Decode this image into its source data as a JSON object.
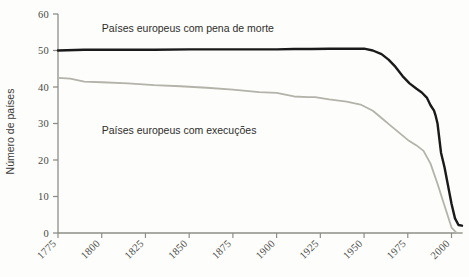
{
  "chart_data": {
    "type": "line",
    "title": "",
    "xlabel": "",
    "ylabel": "Número de países",
    "xlim": [
      1775,
      2006
    ],
    "ylim": [
      0,
      60
    ],
    "grid": false,
    "legend_position": "inline-annotations",
    "xticks": [
      1775,
      1800,
      1825,
      1850,
      1875,
      1900,
      1925,
      1950,
      1975,
      2000
    ],
    "xtick_labels": [
      "1775",
      "1800",
      "1825",
      "1850",
      "1875",
      "1900",
      "1925",
      "1950",
      "1975",
      "2000"
    ],
    "yticks": [
      0,
      10,
      20,
      30,
      40,
      50,
      60
    ],
    "ytick_labels": [
      "0",
      "10",
      "20",
      "30",
      "40",
      "50",
      "60"
    ],
    "series": [
      {
        "name": "Países europeus com pena de morte",
        "color": "#1a1a1a",
        "label_x": 1800,
        "label_y": 55,
        "x": [
          1775,
          1790,
          1810,
          1830,
          1850,
          1870,
          1890,
          1900,
          1910,
          1920,
          1930,
          1940,
          1945,
          1950,
          1955,
          1960,
          1964,
          1968,
          1972,
          1976,
          1980,
          1983,
          1986,
          1988,
          1990,
          1991,
          1992,
          1994,
          1996,
          1998,
          2000,
          2002,
          2004,
          2006
        ],
        "values": [
          50,
          50.2,
          50.2,
          50.2,
          50.3,
          50.3,
          50.3,
          50.3,
          50.4,
          50.4,
          50.5,
          50.5,
          50.5,
          50.5,
          50,
          49,
          47.5,
          45.5,
          43,
          41,
          39.5,
          38.5,
          37,
          35,
          33.5,
          32,
          30,
          22,
          18,
          13,
          8,
          4,
          2.2,
          2
        ]
      },
      {
        "name": "Países europeus com execuções",
        "color": "#b3b3aa",
        "label_x": 1800,
        "label_y": 27,
        "x": [
          1775,
          1782,
          1790,
          1800,
          1815,
          1830,
          1845,
          1860,
          1875,
          1890,
          1900,
          1910,
          1918,
          1922,
          1930,
          1940,
          1948,
          1955,
          1960,
          1965,
          1970,
          1975,
          1980,
          1984,
          1988,
          1992,
          1995,
          1998,
          2000,
          2003,
          2006
        ],
        "values": [
          42.5,
          42.3,
          41.5,
          41.3,
          41,
          40.5,
          40.2,
          39.8,
          39.3,
          38.6,
          38.4,
          37.4,
          37.2,
          37.2,
          36.6,
          36,
          35.2,
          33.5,
          31.5,
          29.5,
          27.5,
          25.5,
          24,
          22.5,
          19,
          13.5,
          9,
          4.5,
          1.5,
          0,
          0
        ]
      }
    ]
  }
}
